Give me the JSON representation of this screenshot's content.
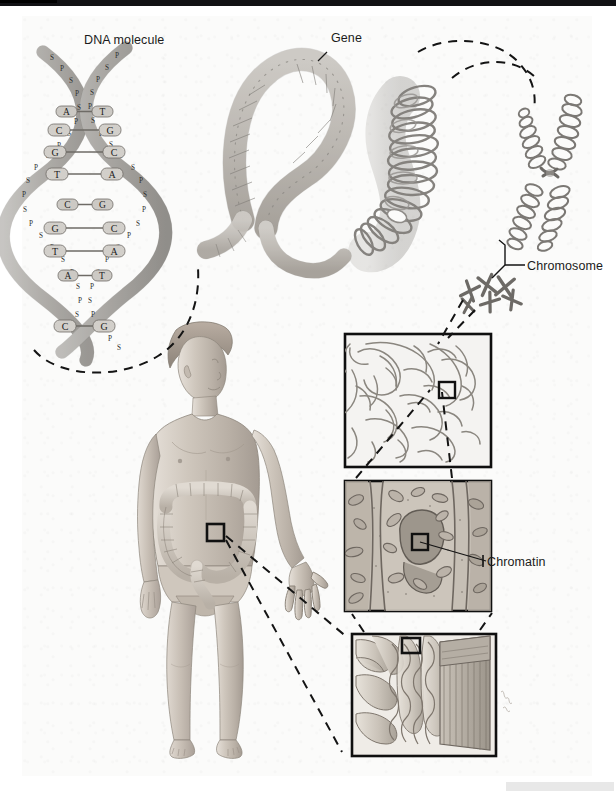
{
  "figure": {
    "domain": "biological-illustration",
    "title_visible": false,
    "background_color": "#fbfbfa",
    "ink_color": "#6f6f71",
    "label_color": "#1b1b1b"
  },
  "labels": {
    "dna_molecule": "DNA molecule",
    "gene": "Gene",
    "chromosome": "Chromosome",
    "chromatin": "Chromatin"
  },
  "dna": {
    "caption": "DNA molecule",
    "backbone_letters": [
      "P",
      "S"
    ],
    "base_pairs": [
      {
        "left": "A",
        "right": "T"
      },
      {
        "left": "C",
        "right": "G"
      },
      {
        "left": "G",
        "right": "C"
      },
      {
        "left": "T",
        "right": "A"
      },
      {
        "left": "C",
        "right": "G"
      },
      {
        "left": "G",
        "right": "C"
      },
      {
        "left": "T",
        "right": "A"
      },
      {
        "left": "A",
        "right": "T"
      },
      {
        "left": "C",
        "right": "G"
      }
    ]
  },
  "panels": [
    {
      "name": "chromatin-threads-panel",
      "caption": "",
      "content": "tangled chromatin threads in nucleus",
      "highlight_box": true
    },
    {
      "name": "cell-micrograph-panel",
      "caption": "Chromatin",
      "content": "epithelial cells with nucleus",
      "highlight_box": true
    },
    {
      "name": "intestinal-villi-panel",
      "caption": "",
      "content": "intestinal villi cross-section",
      "highlight_box": true
    }
  ],
  "body_figure": {
    "name": "human-male-figure",
    "organ_shown": "large intestine",
    "highlight_box": true
  },
  "chromosome_cluster": {
    "count_small": 5,
    "large_chromosome": "metaphase X-shaped chromosome"
  },
  "colors": {
    "ink": "#6f6f71",
    "ink_dark": "#4a4a4c",
    "fill_light": "#d8d8d6",
    "fill_mid": "#b9b9b6",
    "skin": "#cfc6bd",
    "dash": "#1a1a1a"
  }
}
